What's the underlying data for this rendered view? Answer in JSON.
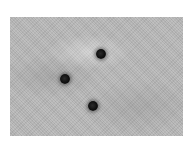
{
  "image": {
    "description": "Grayscale textured surface with three dark spots",
    "background_color": "#b9b9b9",
    "spot_color": "#111111",
    "spots": [
      {
        "id": "spot-1",
        "x": 91,
        "y": 37
      },
      {
        "id": "spot-2",
        "x": 55,
        "y": 62
      },
      {
        "id": "spot-3",
        "x": 83,
        "y": 89
      }
    ]
  }
}
